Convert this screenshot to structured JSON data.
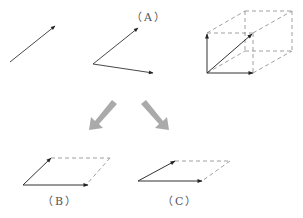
{
  "labels": {
    "a": "（A）",
    "b": "（B）",
    "c": "（C）"
  },
  "colors": {
    "line": "#333333",
    "dash": "#777777",
    "arrow_gray": "#aaaaaa"
  }
}
